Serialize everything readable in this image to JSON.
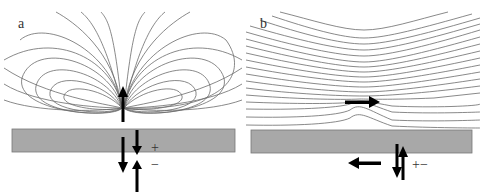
{
  "figure": {
    "panels": [
      {
        "id": "a",
        "label": "a",
        "description": "Dipole field lines of a vertical (upward) moment above a surface, with image charge arrows below",
        "dipole_orientation": "up",
        "signs": {
          "plus": "+",
          "minus": "−"
        }
      },
      {
        "id": "b",
        "label": "b",
        "description": "Field lines of a horizontal (rightward) moment above a surface, with antiparallel image arrow below",
        "dipole_orientation": "right",
        "signs": {
          "plus_minus": "+−"
        }
      }
    ],
    "colors": {
      "field_line": "#6b6b6b",
      "surface": "#a8a8a8",
      "surface_border": "#777777",
      "arrow": "#000000"
    }
  }
}
